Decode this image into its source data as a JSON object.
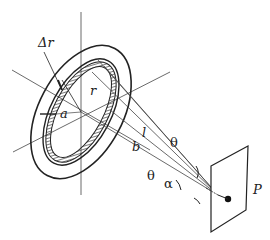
{
  "diagram": {
    "type": "physics-geometry",
    "labels": {
      "delta_r": "Δr",
      "r": "r",
      "a": "a",
      "l": "l",
      "b": "b",
      "theta_upper": "θ",
      "theta_lower": "θ",
      "alpha": "α",
      "P": "P"
    },
    "colors": {
      "ink": "#222222",
      "background": "#ffffff"
    }
  }
}
